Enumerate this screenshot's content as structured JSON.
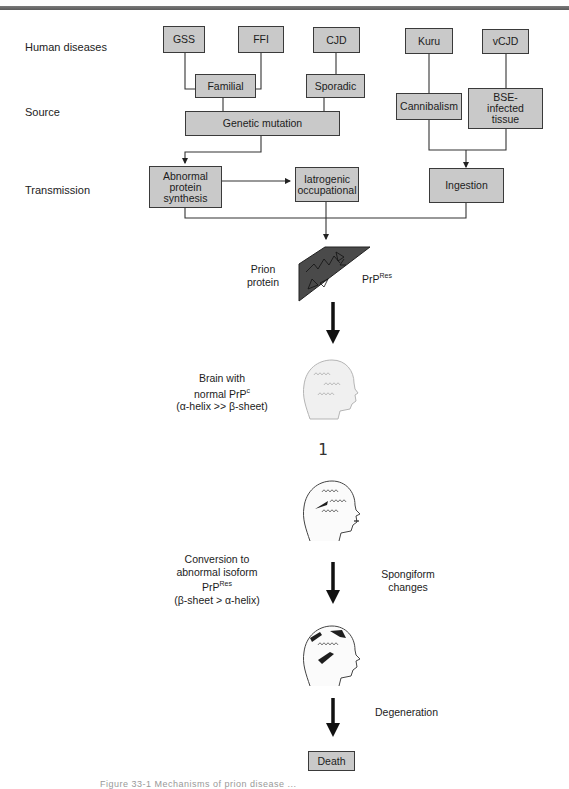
{
  "figure": {
    "row_labels": {
      "diseases": "Human diseases",
      "source": "Source",
      "transmission": "Transmission"
    },
    "diseases": {
      "gss": "GSS",
      "ffi": "FFI",
      "cjd": "CJD",
      "kuru": "Kuru",
      "vcjd": "vCJD"
    },
    "sources": {
      "familial": "Familial",
      "sporadic": "Sporadic",
      "genetic_mutation": "Genetic mutation",
      "cannibalism": "Cannibalism",
      "bse_line1": "BSE-",
      "bse_line2": "infected",
      "bse_line3": "tissue"
    },
    "transmission": {
      "abnormal_line1": "Abnormal",
      "abnormal_line2": "protein",
      "abnormal_line3": "synthesis",
      "iatrogenic_line1": "Iatrogenic",
      "iatrogenic_line2": "occupational",
      "ingestion": "Ingestion"
    },
    "prion": {
      "label_line1": "Prion",
      "label_line2": "protein",
      "prp_base": "PrP",
      "prp_sup": "Res"
    },
    "brain_normal": {
      "line1": "Brain with",
      "line2_base": "normal PrP",
      "line2_sup": "c",
      "line3": "(α-helix >> β-sheet)"
    },
    "stray_glyph": "1",
    "conversion": {
      "line1": "Conversion to",
      "line2": "abnormal isoform",
      "line3_base": "PrP",
      "line3_sup": "Res",
      "line4": "(β-sheet > α-helix)"
    },
    "spongiform": {
      "line1": "Spongiform",
      "line2": "changes"
    },
    "degeneration": "Degeneration",
    "death": "Death",
    "caption": "Figure 33-1   Mechanisms of prion disease ..."
  },
  "colors": {
    "box_fill": "#c9c9c9",
    "box_border": "#3a3a3a",
    "prion_fill": "#4a4a4a",
    "lesion": "#1e1e1e"
  }
}
